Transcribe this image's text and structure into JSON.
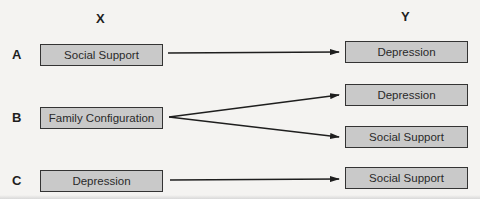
{
  "columns": {
    "x_label": "X",
    "y_label": "Y"
  },
  "rows": [
    {
      "label": "A",
      "source": "Social Support",
      "targets": [
        "Depression"
      ]
    },
    {
      "label": "B",
      "source": "Family Configuration",
      "targets": [
        "Depression",
        "Social Support"
      ]
    },
    {
      "label": "C",
      "source": "Depression",
      "targets": [
        "Social Support"
      ]
    }
  ],
  "colors": {
    "box_fill": "#c9c9c9",
    "box_border": "#333333",
    "line": "#1e1e1e",
    "background": "#f4f3f1"
  }
}
